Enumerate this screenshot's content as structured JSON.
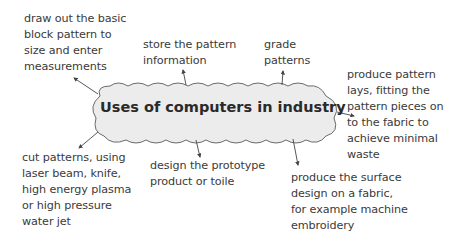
{
  "diagram": {
    "central_topic": "Uses of computers in industry",
    "colors": {
      "cloud_fill": "#ececec",
      "cloud_stroke": "#6b6b6b",
      "text": "#3a3a3a",
      "arrow": "#444444"
    },
    "nodes": [
      {
        "id": "draw",
        "lines": [
          "draw out the basic",
          "block pattern to",
          "size and enter",
          "measurements"
        ]
      },
      {
        "id": "store",
        "lines": [
          "store the pattern",
          "information"
        ]
      },
      {
        "id": "grade",
        "lines": [
          "grade",
          "patterns"
        ]
      },
      {
        "id": "lays",
        "lines": [
          "produce pattern",
          "lays, fitting the",
          "pattern pieces on",
          "to the fabric to",
          "achieve minimal",
          "waste"
        ]
      },
      {
        "id": "cut",
        "lines": [
          "cut patterns, using",
          "laser beam, knife,",
          "high energy plasma",
          "or high pressure",
          "water jet"
        ]
      },
      {
        "id": "prototype",
        "lines": [
          "design the prototype",
          "product or toile"
        ]
      },
      {
        "id": "surface",
        "lines": [
          "produce the surface",
          "design on a fabric,",
          "for example machine",
          "embroidery"
        ]
      }
    ]
  }
}
